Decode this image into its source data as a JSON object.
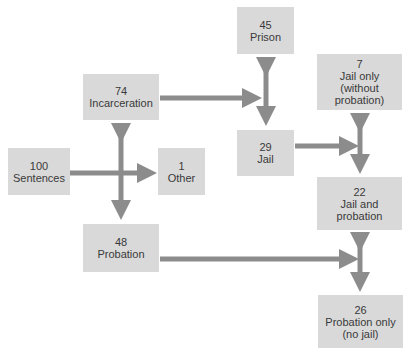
{
  "colors": {
    "box_fill": "#d9d9d9",
    "arrow": "#8c8c8c",
    "text": "#3a3a3a"
  },
  "nodes": {
    "sentences": {
      "value": "100",
      "label": [
        "Sentences"
      ]
    },
    "incarceration": {
      "value": "74",
      "label": [
        "Incarceration"
      ]
    },
    "other": {
      "value": "1",
      "label": [
        "Other"
      ]
    },
    "probation": {
      "value": "48",
      "label": [
        "Probation"
      ]
    },
    "prison": {
      "value": "45",
      "label": [
        "Prison"
      ]
    },
    "jail": {
      "value": "29",
      "label": [
        "Jail"
      ]
    },
    "jail_only": {
      "value": "7",
      "label": [
        "Jail only",
        "(without",
        "probation)"
      ]
    },
    "jail_and_probation": {
      "value": "22",
      "label": [
        "Jail and",
        "probation"
      ]
    },
    "probation_only": {
      "value": "26",
      "label": [
        "Probation only",
        "(no jail)"
      ]
    }
  },
  "edges": [
    {
      "from": "sentences",
      "to": "other",
      "type": "single"
    },
    {
      "from": "incarceration",
      "to": "probation",
      "type": "double"
    },
    {
      "from": "incarceration",
      "to": "prison-jail-split",
      "type": "single"
    },
    {
      "from": "prison",
      "to": "jail",
      "type": "double"
    },
    {
      "from": "jail",
      "to": "jail-split",
      "type": "single"
    },
    {
      "from": "jail_only",
      "to": "jail_and_probation",
      "type": "double"
    },
    {
      "from": "probation",
      "to": "probation-split",
      "type": "single"
    },
    {
      "from": "jail_and_probation",
      "to": "probation_only",
      "type": "double"
    }
  ]
}
